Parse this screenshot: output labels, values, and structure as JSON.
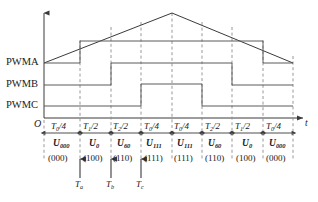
{
  "figure": {
    "type": "svpwm-switching-sequence-timing-diagram",
    "origin_label": "O",
    "time_axis_label": "t"
  },
  "signals": [
    {
      "name": "PWMA",
      "label": "PWMA"
    },
    {
      "name": "PWMB",
      "label": "PWMB"
    },
    {
      "name": "PWMC",
      "label": "PWMC"
    }
  ],
  "carrier": {
    "shape": "triangular",
    "description": "isosceles triangle carrier"
  },
  "segments": [
    {
      "time_num": "T",
      "time_sub": "0",
      "time_den": "/4",
      "vector": "U",
      "vector_sub": "000",
      "bits": "(000)"
    },
    {
      "time_num": "T",
      "time_sub": "1",
      "time_den": "/2",
      "vector": "U",
      "vector_sub": "0",
      "bits": "(100)"
    },
    {
      "time_num": "T",
      "time_sub": "2",
      "time_den": "/2",
      "vector": "U",
      "vector_sub": "60",
      "bits": "(110)"
    },
    {
      "time_num": "T",
      "time_sub": "0",
      "time_den": "/4",
      "vector": "U",
      "vector_sub": "111",
      "bits": "(111)"
    },
    {
      "time_num": "T",
      "time_sub": "0",
      "time_den": "/4",
      "vector": "U",
      "vector_sub": "111",
      "bits": "(111)"
    },
    {
      "time_num": "T",
      "time_sub": "2",
      "time_den": "/2",
      "vector": "U",
      "vector_sub": "60",
      "bits": "(110)"
    },
    {
      "time_num": "T",
      "time_sub": "1",
      "time_den": "/2",
      "vector": "U",
      "vector_sub": "0",
      "bits": "(100)"
    },
    {
      "time_num": "T",
      "time_sub": "0",
      "time_den": "/4",
      "vector": "U",
      "vector_sub": "000",
      "bits": "(000)"
    }
  ],
  "switch_markers": [
    {
      "name": "Ta",
      "base": "T",
      "sub": "a"
    },
    {
      "name": "Tb",
      "base": "T",
      "sub": "b"
    },
    {
      "name": "Tc",
      "base": "T",
      "sub": "c"
    }
  ],
  "colors": {
    "line": "#3a3a3a",
    "dashed": "#8c8c8c",
    "text": "#1a1a1a"
  }
}
